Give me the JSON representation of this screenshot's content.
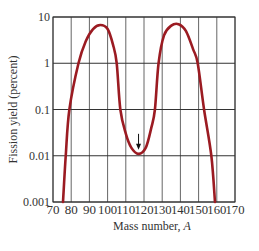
{
  "chart_data": {
    "type": "line",
    "title": "",
    "xlabel": "Mass number, A",
    "xlabel_main": "Mass number, ",
    "xlabel_italic": "A",
    "ylabel": "Fission yield (percent)",
    "xlim": [
      70,
      170
    ],
    "ylim": [
      0.001,
      10
    ],
    "yscale": "log",
    "grid": true,
    "x_ticks": [
      70,
      80,
      90,
      100,
      110,
      120,
      130,
      140,
      150,
      160,
      170
    ],
    "y_ticks": [
      0.001,
      0.01,
      0.1,
      1,
      10
    ],
    "y_tick_labels": [
      "0.001",
      "0.01",
      "0.1",
      "1",
      "10"
    ],
    "series": [
      {
        "name": "Fission yield",
        "color": "#9b1b22",
        "x": [
          75.5,
          77,
          79,
          84,
          88,
          92,
          96,
          100,
          103,
          105,
          107,
          110,
          113,
          117,
          121,
          124,
          126,
          128,
          131,
          135,
          139,
          143,
          147,
          149.5,
          153,
          157,
          159
        ],
        "y": [
          0.001,
          0.01,
          0.1,
          1,
          3,
          5.5,
          6.7,
          5.5,
          2.5,
          1,
          0.1,
          0.03,
          0.015,
          0.011,
          0.015,
          0.04,
          0.1,
          1,
          4,
          6.5,
          7,
          5,
          2,
          1,
          0.1,
          0.01,
          0.001
        ]
      }
    ],
    "annotations": [
      {
        "type": "arrow",
        "x": 117,
        "y": 0.011,
        "direction": "down",
        "note": "symmetric fission minimum"
      }
    ]
  }
}
